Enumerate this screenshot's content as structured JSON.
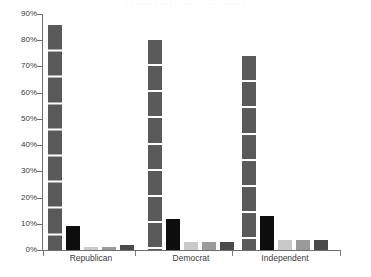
{
  "title_remnant": "· · · · · · · · · · · · · · · · · · · · · · · · ·",
  "chart_data": {
    "type": "bar",
    "title": "",
    "xlabel": "",
    "ylabel": "",
    "ylim": [
      0,
      90
    ],
    "grid": true,
    "grid_axis": "y",
    "legend": false,
    "categories": [
      "Republican",
      "Democrat",
      "Independent"
    ],
    "ytick_labels": [
      "0%",
      "10%",
      "20%",
      "30%",
      "40%",
      "50%",
      "60%",
      "70%",
      "80%",
      "90%"
    ],
    "ytick_values": [
      0,
      10,
      20,
      30,
      40,
      50,
      60,
      70,
      80,
      90
    ],
    "series": [
      {
        "name": "series-1",
        "color": "#595959",
        "values": [
          86,
          80,
          74
        ],
        "labels": [
          "86",
          "80",
          "74"
        ]
      },
      {
        "name": "series-2",
        "color": "#0d0d0d",
        "values": [
          9,
          12,
          13
        ],
        "labels": [
          "9",
          "12",
          "13"
        ]
      },
      {
        "name": "series-3",
        "color": "#c9c9c9",
        "values": [
          1,
          3,
          4
        ],
        "labels": [
          "1",
          "3",
          "4"
        ]
      },
      {
        "name": "series-4",
        "color": "#9a9a9a",
        "values": [
          1,
          3,
          4
        ],
        "labels": [
          "1",
          "3",
          "4"
        ]
      },
      {
        "name": "series-5",
        "color": "#4a4a4a",
        "values": [
          2,
          3,
          4
        ],
        "labels": [
          "2",
          "3",
          "4"
        ]
      }
    ]
  },
  "axis": {
    "line_color": "#6f6f6f",
    "group_separators": [
      3
    ]
  }
}
